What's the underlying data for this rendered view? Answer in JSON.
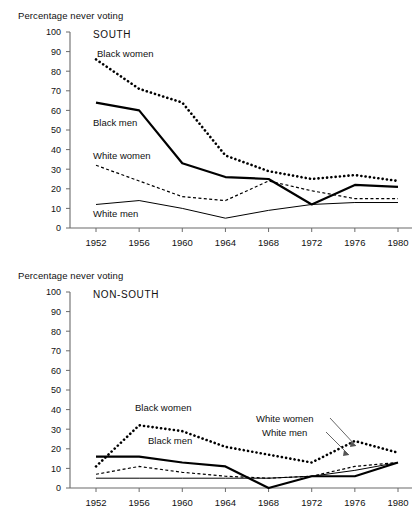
{
  "figure": {
    "axis_title": "Percentage never voting",
    "years": [
      1952,
      1956,
      1960,
      1964,
      1968,
      1972,
      1976,
      1980
    ],
    "y_ticks": [
      0,
      10,
      20,
      30,
      40,
      50,
      60,
      70,
      80,
      90,
      100
    ],
    "colors": {
      "ink": "#111111",
      "line": "#000000",
      "axis": "#6b6b6b"
    }
  },
  "panels": [
    {
      "id": "south",
      "region_label": "SOUTH",
      "axis_title": "Percentage never voting",
      "labels": {
        "black_women": "Black women",
        "black_men": "Black men",
        "white_women": "White women",
        "white_men": "White men"
      }
    },
    {
      "id": "nonsouth",
      "region_label": "NON-SOUTH",
      "axis_title": "Percentage never voting",
      "labels": {
        "black_women": "Black women",
        "black_men": "Black men",
        "white_women": "White women",
        "white_men": "White men"
      }
    }
  ],
  "chart_data": [
    {
      "type": "line",
      "title": "SOUTH",
      "xlabel": "",
      "ylabel": "Percentage never voting",
      "x": [
        1952,
        1956,
        1960,
        1964,
        1968,
        1972,
        1976,
        1980
      ],
      "xlim": [
        1952,
        1980
      ],
      "ylim": [
        0,
        100
      ],
      "yticks": [
        0,
        10,
        20,
        30,
        40,
        50,
        60,
        70,
        80,
        90,
        100
      ],
      "grid": false,
      "legend": "inline-annotations",
      "series": [
        {
          "name": "Black women",
          "style": "bold-dotted",
          "values": [
            86,
            71,
            64,
            37,
            29,
            25,
            27,
            24
          ]
        },
        {
          "name": "Black men",
          "style": "bold-solid",
          "values": [
            64,
            60,
            33,
            26,
            25,
            12,
            22,
            21
          ]
        },
        {
          "name": "White women",
          "style": "thin-dotted",
          "values": [
            32,
            24,
            16,
            14,
            24,
            19,
            15,
            15
          ]
        },
        {
          "name": "White men",
          "style": "thin-solid",
          "values": [
            12,
            14,
            10,
            5,
            9,
            12,
            13,
            13
          ]
        }
      ]
    },
    {
      "type": "line",
      "title": "NON-SOUTH",
      "xlabel": "",
      "ylabel": "Percentage never voting",
      "x": [
        1952,
        1956,
        1960,
        1964,
        1968,
        1972,
        1976,
        1980
      ],
      "xlim": [
        1952,
        1980
      ],
      "ylim": [
        0,
        100
      ],
      "yticks": [
        0,
        10,
        20,
        30,
        40,
        50,
        60,
        70,
        80,
        90,
        100
      ],
      "grid": false,
      "legend": "inline-annotations",
      "series": [
        {
          "name": "Black women",
          "style": "bold-dotted",
          "values": [
            11,
            32,
            29,
            21,
            17,
            13,
            24,
            18
          ]
        },
        {
          "name": "Black men",
          "style": "bold-solid",
          "values": [
            16,
            16,
            13,
            11,
            0,
            6,
            6,
            13
          ]
        },
        {
          "name": "White women",
          "style": "thin-dotted",
          "values": [
            7,
            11,
            8,
            6,
            5,
            6,
            11,
            13
          ]
        },
        {
          "name": "White men",
          "style": "thin-solid",
          "values": [
            5,
            5,
            5,
            5,
            5,
            6,
            9,
            13
          ]
        }
      ]
    }
  ]
}
